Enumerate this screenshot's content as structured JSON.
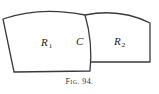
{
  "figure": {
    "caption_prefix": "Fig.",
    "caption_number": "94.",
    "stroke_color": "#3a3a3a",
    "background": "#ffffff"
  },
  "regions": [
    {
      "id": "R1",
      "label_letter": "R",
      "label_sub": "1",
      "x": 40,
      "y": 37
    },
    {
      "id": "R2",
      "label_letter": "R",
      "label_sub": "2",
      "x": 114,
      "y": 36
    }
  ],
  "curve": {
    "label": "C",
    "x": 76,
    "y": 36
  }
}
